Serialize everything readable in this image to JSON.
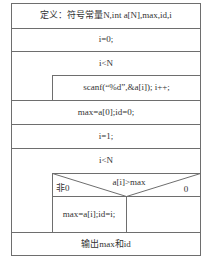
{
  "diagram": {
    "type": "N-S flowchart",
    "blocks": {
      "definition": "定义：符号常量N,int a[N],max,id,i",
      "init_i": "i=0;",
      "loop1_condition": "i<N",
      "loop1_body": "scanf(“%d”,&a[i]);   i++;",
      "init_max": "max=a[0];id=0;",
      "init_i2": "i=1;",
      "loop2_condition": "i<N",
      "if_condition": "a[i]>max",
      "true_label": "非0",
      "false_label": "0",
      "true_branch": "max=a[i];id=i;",
      "false_branch": "",
      "output": "输出max和id"
    },
    "colors": {
      "line": "#6e6e6e",
      "text": "#333333",
      "background": "#ffffff"
    }
  }
}
